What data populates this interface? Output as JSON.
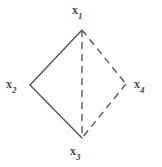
{
  "figure": {
    "width": 162,
    "height": 167,
    "background_color": "#ffffff",
    "stroke_color": "#555555",
    "label_color": "#4a4a4a"
  },
  "chart_data": {
    "type": "diagram",
    "subtype": "undirected-graph",
    "title": "",
    "nodes": [
      {
        "id": "x1",
        "base": "x",
        "subscript": "1",
        "x": 82,
        "y": 30,
        "label_x": 72,
        "label_y": 4,
        "label_position": "above"
      },
      {
        "id": "x2",
        "base": "x",
        "subscript": "2",
        "x": 30,
        "y": 85,
        "label_x": 6,
        "label_y": 78,
        "label_position": "left"
      },
      {
        "id": "x3",
        "base": "x",
        "subscript": "3",
        "x": 82,
        "y": 138,
        "label_x": 70,
        "label_y": 145,
        "label_position": "below"
      },
      {
        "id": "x4",
        "base": "x",
        "subscript": "4",
        "x": 126,
        "y": 84,
        "label_x": 134,
        "label_y": 78,
        "label_position": "right"
      }
    ],
    "edges": [
      {
        "id": "e-x1-x2",
        "from": "x1",
        "to": "x2",
        "style": "solid",
        "x1": 82,
        "y1": 30,
        "x2": 30,
        "y2": 85
      },
      {
        "id": "e-x2-x3",
        "from": "x2",
        "to": "x3",
        "style": "solid",
        "x1": 30,
        "y1": 85,
        "x2": 82,
        "y2": 138
      },
      {
        "id": "e-x1-x4",
        "from": "x1",
        "to": "x4",
        "style": "dashed",
        "x1": 82,
        "y1": 30,
        "x2": 126,
        "y2": 84
      },
      {
        "id": "e-x4-x3",
        "from": "x4",
        "to": "x3",
        "style": "dashed",
        "x1": 126,
        "y1": 84,
        "x2": 82,
        "y2": 138
      },
      {
        "id": "e-x1-x3",
        "from": "x1",
        "to": "x3",
        "style": "dashed",
        "x1": 82,
        "y1": 30,
        "x2": 82,
        "y2": 138
      }
    ]
  }
}
